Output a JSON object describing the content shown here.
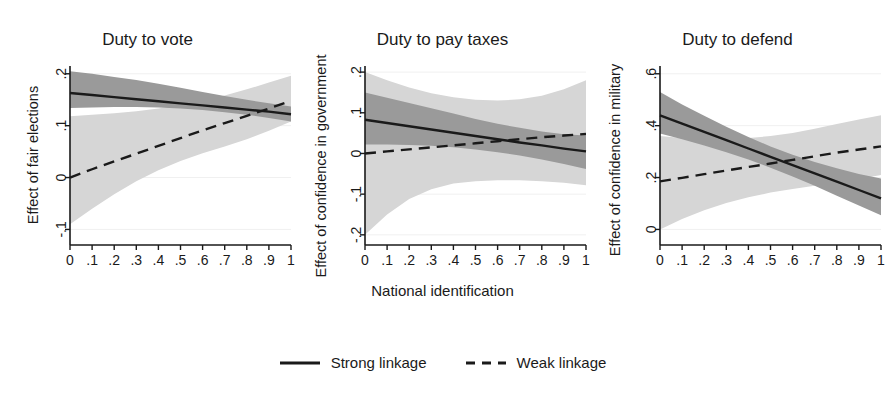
{
  "figure": {
    "xlabel": "National identification",
    "legend": {
      "position": "bottom-center",
      "items": [
        {
          "label": "Strong linkage",
          "style": "solid",
          "color": "#1a1a1a"
        },
        {
          "label": "Weak linkage",
          "style": "dashed",
          "color": "#1a1a1a"
        }
      ]
    },
    "colors": {
      "line": "#1a1a1a",
      "ci_strong_band": "#9a9a9a",
      "ci_weak_band": "#d6d6d6",
      "axis": "#1a1a1a",
      "grid": "#f0f0f0",
      "background": "#ffffff"
    }
  },
  "chart_data": [
    {
      "type": "line",
      "title": "Duty to vote",
      "xlabel": "National identification",
      "ylabel": "Effect of fair elections",
      "xlim": [
        0,
        1
      ],
      "ylim": [
        -0.13,
        0.215
      ],
      "xticks": [
        0,
        0.1,
        0.2,
        0.3,
        0.4,
        0.5,
        0.6,
        0.7,
        0.8,
        0.9,
        1
      ],
      "xticklabels": [
        "0",
        ".1",
        ".2",
        ".3",
        ".4",
        ".5",
        ".6",
        ".7",
        ".8",
        ".9",
        "1"
      ],
      "yticks": [
        -0.1,
        0,
        0.1,
        0.2
      ],
      "yticklabels": [
        "-.1",
        "0",
        ".1",
        ".2"
      ],
      "grid": true,
      "x": [
        0,
        0.1,
        0.2,
        0.3,
        0.4,
        0.5,
        0.6,
        0.7,
        0.8,
        0.9,
        1
      ],
      "series": [
        {
          "name": "Strong linkage",
          "style": "solid",
          "values": [
            0.163,
            0.159,
            0.155,
            0.151,
            0.147,
            0.143,
            0.139,
            0.135,
            0.131,
            0.127,
            0.122
          ],
          "ci_lower": [
            0.134,
            0.135,
            0.136,
            0.136,
            0.135,
            0.133,
            0.13,
            0.126,
            0.121,
            0.115,
            0.108
          ],
          "ci_upper": [
            0.205,
            0.2,
            0.194,
            0.188,
            0.181,
            0.173,
            0.165,
            0.157,
            0.15,
            0.143,
            0.137
          ],
          "band_color": "#9a9a9a"
        },
        {
          "name": "Weak linkage",
          "style": "dashed",
          "values": [
            0.0,
            0.016,
            0.031,
            0.046,
            0.061,
            0.076,
            0.091,
            0.105,
            0.119,
            0.133,
            0.148
          ],
          "ci_lower": [
            -0.09,
            -0.06,
            -0.032,
            -0.007,
            0.014,
            0.032,
            0.047,
            0.06,
            0.074,
            0.09,
            0.108
          ],
          "ci_upper": [
            0.118,
            0.121,
            0.124,
            0.128,
            0.133,
            0.14,
            0.148,
            0.158,
            0.17,
            0.183,
            0.196
          ],
          "band_color": "#d6d6d6"
        }
      ]
    },
    {
      "type": "line",
      "title": "Duty to pay taxes",
      "xlabel": "National identification",
      "ylabel": "Effect of confidence in government",
      "xlim": [
        0,
        1
      ],
      "ylim": [
        -0.225,
        0.215
      ],
      "xticks": [
        0,
        0.1,
        0.2,
        0.3,
        0.4,
        0.5,
        0.6,
        0.7,
        0.8,
        0.9,
        1
      ],
      "xticklabels": [
        "0",
        ".1",
        ".2",
        ".3",
        ".4",
        ".5",
        ".6",
        ".7",
        ".8",
        ".9",
        "1"
      ],
      "yticks": [
        -0.2,
        -0.1,
        0,
        0.1,
        0.2
      ],
      "yticklabels": [
        "-.2",
        "-.1",
        "0",
        ".1",
        ".2"
      ],
      "grid": true,
      "x": [
        0,
        0.1,
        0.2,
        0.3,
        0.4,
        0.5,
        0.6,
        0.7,
        0.8,
        0.9,
        1
      ],
      "series": [
        {
          "name": "Strong linkage",
          "style": "solid",
          "values": [
            0.083,
            0.075,
            0.067,
            0.059,
            0.051,
            0.043,
            0.035,
            0.027,
            0.02,
            0.012,
            0.005
          ],
          "ci_lower": [
            0.022,
            0.022,
            0.021,
            0.019,
            0.015,
            0.01,
            0.003,
            -0.005,
            -0.015,
            -0.026,
            -0.038
          ],
          "ci_upper": [
            0.15,
            0.137,
            0.124,
            0.111,
            0.098,
            0.085,
            0.073,
            0.063,
            0.054,
            0.047,
            0.044
          ],
          "band_color": "#9a9a9a"
        },
        {
          "name": "Weak linkage",
          "style": "dashed",
          "values": [
            0.0,
            0.005,
            0.01,
            0.015,
            0.02,
            0.025,
            0.03,
            0.035,
            0.04,
            0.044,
            0.048
          ],
          "ci_lower": [
            -0.2,
            -0.15,
            -0.112,
            -0.088,
            -0.074,
            -0.068,
            -0.066,
            -0.066,
            -0.068,
            -0.072,
            -0.078
          ],
          "ci_upper": [
            0.2,
            0.18,
            0.162,
            0.148,
            0.138,
            0.132,
            0.13,
            0.133,
            0.142,
            0.158,
            0.18
          ],
          "band_color": "#d6d6d6"
        }
      ]
    },
    {
      "type": "line",
      "title": "Duty to defend",
      "xlabel": "National identification",
      "ylabel": "Effect of confidence in military",
      "xlim": [
        0,
        1
      ],
      "ylim": [
        -0.06,
        0.63
      ],
      "xticks": [
        0,
        0.1,
        0.2,
        0.3,
        0.4,
        0.5,
        0.6,
        0.7,
        0.8,
        0.9,
        1
      ],
      "xticklabels": [
        "0",
        ".1",
        ".2",
        ".3",
        ".4",
        ".5",
        ".6",
        ".7",
        ".8",
        ".9",
        "1"
      ],
      "yticks": [
        0,
        0.2,
        0.4,
        0.6
      ],
      "yticklabels": [
        "0",
        ".2",
        ".4",
        ".6"
      ],
      "grid": true,
      "x": [
        0,
        0.1,
        0.2,
        0.3,
        0.4,
        0.5,
        0.6,
        0.7,
        0.8,
        0.9,
        1
      ],
      "series": [
        {
          "name": "Strong linkage",
          "style": "solid",
          "values": [
            0.44,
            0.408,
            0.376,
            0.344,
            0.312,
            0.28,
            0.248,
            0.216,
            0.184,
            0.152,
            0.12
          ],
          "ci_lower": [
            0.37,
            0.348,
            0.324,
            0.298,
            0.27,
            0.238,
            0.204,
            0.168,
            0.13,
            0.092,
            0.055
          ],
          "ci_upper": [
            0.53,
            0.482,
            0.438,
            0.396,
            0.356,
            0.32,
            0.288,
            0.26,
            0.236,
            0.214,
            0.196
          ],
          "band_color": "#9a9a9a"
        },
        {
          "name": "Weak linkage",
          "style": "dashed",
          "values": [
            0.185,
            0.199,
            0.213,
            0.227,
            0.241,
            0.254,
            0.268,
            0.282,
            0.296,
            0.308,
            0.32
          ],
          "ci_lower": [
            0.0,
            0.04,
            0.074,
            0.102,
            0.124,
            0.142,
            0.156,
            0.168,
            0.18,
            0.194,
            0.21
          ],
          "ci_upper": [
            0.36,
            0.352,
            0.348,
            0.348,
            0.352,
            0.36,
            0.372,
            0.388,
            0.406,
            0.424,
            0.44
          ],
          "band_color": "#d6d6d6"
        }
      ]
    }
  ]
}
